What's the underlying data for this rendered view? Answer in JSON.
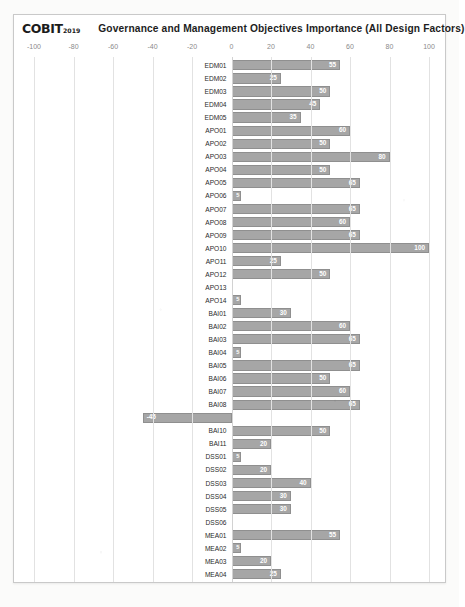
{
  "brand": {
    "logo_text": "COBIT",
    "logo_year": "2019"
  },
  "header": {
    "title": "Governance and Management Objectives Importance (All Design Factors)"
  },
  "chart_data": {
    "type": "bar",
    "orientation": "horizontal",
    "title": "Governance and Management Objectives Importance (All Design Factors)",
    "xlabel": "",
    "ylabel": "",
    "xlim": [
      -100,
      100
    ],
    "xticks": [
      -100,
      -80,
      -60,
      -40,
      -20,
      0,
      20,
      40,
      60,
      80,
      100
    ],
    "xtick_labels": [
      "-100",
      "-80",
      "-60",
      "-40",
      "-20",
      "0",
      "20",
      "40",
      "60",
      "80",
      "100"
    ],
    "grid": true,
    "legend": "none",
    "bar_color": "#a6a6a6",
    "bar_border_color": "#8f8f8f",
    "value_label_color": "#ffffff",
    "categories": [
      "EDM01",
      "EDM02",
      "EDM03",
      "EDM04",
      "EDM05",
      "APO01",
      "APO02",
      "APO03",
      "APO04",
      "APO05",
      "APO06",
      "APO07",
      "APO08",
      "APO09",
      "APO10",
      "APO11",
      "APO12",
      "APO13",
      "APO14",
      "BAI01",
      "BAI02",
      "BAI03",
      "BAI04",
      "BAI05",
      "BAI06",
      "BAI07",
      "BAI08",
      "BAI09",
      "BAI10",
      "BAI11",
      "DSS01",
      "DSS02",
      "DSS03",
      "DSS04",
      "DSS05",
      "DSS06",
      "MEA01",
      "MEA02",
      "MEA03",
      "MEA04"
    ],
    "values": [
      55,
      25,
      50,
      45,
      35,
      60,
      50,
      80,
      50,
      65,
      5,
      65,
      60,
      65,
      100,
      25,
      50,
      0,
      5,
      30,
      60,
      65,
      5,
      65,
      50,
      60,
      65,
      -45,
      50,
      20,
      5,
      20,
      40,
      30,
      30,
      0,
      55,
      5,
      20,
      25
    ]
  }
}
